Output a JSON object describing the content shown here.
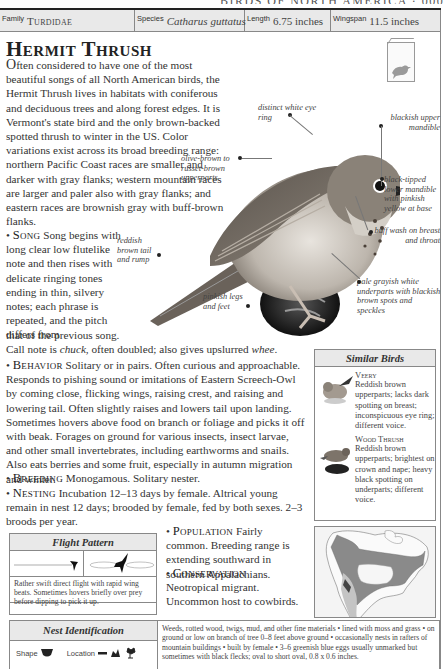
{
  "running_head": "BIRDS OF NORTH AMERICA · 000",
  "info_bar": {
    "family_label": "Family",
    "family_value": "Turdidae",
    "species_label": "Species",
    "species_value": "Catharus guttatus",
    "length_label": "Length",
    "length_value": "6.75 inches",
    "wingspan_label": "Wingspan",
    "wingspan_value": "11.5 inches"
  },
  "title": "Hermit Thrush",
  "intro": {
    "drop": "O",
    "text": "ften considered to have one of the most beautiful songs of all North American birds, the Hermit Thrush lives in habitats with coniferous and deciduous trees and along forest edges. It is Vermont's state bird and the only brown-backed spotted thrush to winter in the US. Color variations exist across its broad breeding range: northern Pacific Coast races are smaller and darker with gray flanks; western mountain races are larger and paler also with gray flanks; and eastern races are brownish gray with buff-brown flanks."
  },
  "sections": {
    "song": {
      "heading": "Song",
      "text": "Song begins with long clear low flutelike note and then rises with delicate ringing tones ending in thin, silvery notes; each phrase is repeated, and the pitch differs from",
      "tail_1": "that of the previous song.",
      "tail_2a": "Call note is ",
      "tail_2b": "chuck",
      "tail_2c": ", often doubled; also gives upslurred ",
      "tail_2d": "whee",
      "tail_2e": "."
    },
    "behavior": {
      "heading": "Behavior",
      "text": "Solitary or in pairs. Often curious and approachable. Responds to pishing sound or imitations of Eastern Screech-Owl by coming close, flicking wings, raising crest, and raising and lowering tail. Often slightly raises and lowers tail upon landing. Sometimes hovers above food on branch or foliage and picks it off with beak. Forages on ground for various insects, insect larvae, and other small invertebrates, including earthworms and snails. Also eats berries and some fruit, especially in autumn migration and winter."
    },
    "breeding": {
      "heading": "Breeding",
      "text": "Monogamous. Solitary nester."
    },
    "nesting": {
      "heading": "Nesting",
      "text": "Incubation 12–13 days by female. Altrical young remain in nest 12 days; brooded by female, fed by both sexes. 2–3 broods per year."
    },
    "population": {
      "heading": "Population",
      "text": "Fairly common. Breeding range is extending southward in southern Appalachians."
    },
    "conservation": {
      "heading": "Conservation",
      "text": "Neotropical migrant. Uncommon host to cowbirds."
    }
  },
  "callouts": {
    "eye_ring": "distinct white eye ring",
    "upper_mandible": "blackish upper mandible",
    "upperparts": "olive-brown to russet-brown upperparts",
    "lower_mandible": "black-tipped lower mandible with pinkish yellow at base",
    "buff_wash": "buff wash on breast and throat",
    "tail": "reddish brown tail and rump",
    "underparts": "pale grayish white underparts with blackish brown spots and speckles",
    "legs": "pinkish legs and feet"
  },
  "similar_birds": {
    "heading": "Similar Birds",
    "items": [
      {
        "name": "Veery",
        "text": "Reddish brown upperparts; lacks dark spotting on breast; inconspicuous eye ring; different voice."
      },
      {
        "name": "Wood Thrush",
        "text": "Reddish brown upperparts; brightest on crown and nape; heavy black spotting on underparts; different voice."
      }
    ]
  },
  "flight_pattern": {
    "heading": "Flight Pattern",
    "text": "Rather swift direct flight with rapid wing beats. Sometimes hovers briefly over prey before dipping to pick it up."
  },
  "nest_identification": {
    "heading": "Nest Identification",
    "shape_label": "Shape",
    "location_label": "Location",
    "text": "Weeds, rotted wood, twigs, mud, and other fine materials • lined with moss and grass • on ground or low on branch of tree 0–8 feet above ground • occasionally nests in rafters of mountain buildings • built by female • 3–6 greenish blue eggs usually unmarked but sometimes with black flecks; oval to short oval, 0.8 x 0.6 inches."
  },
  "colors": {
    "panel_fill": "#e9e9e9",
    "border": "#888888",
    "text": "#333333",
    "map_range_dark": "#8a8a8a",
    "map_range_light": "#c4c4c4"
  }
}
